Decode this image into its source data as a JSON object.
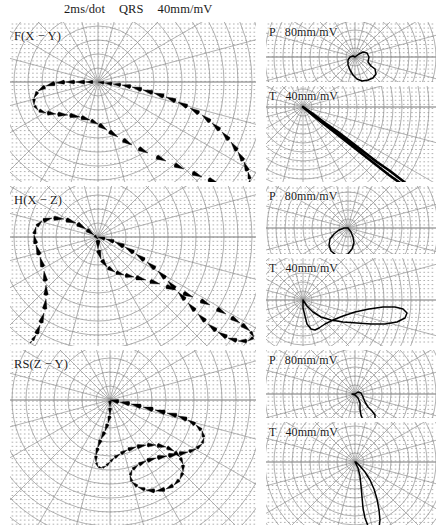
{
  "figure": {
    "type": "vectorcardiogram-polar-loops",
    "header": {
      "speed": "2ms/dot",
      "component": "QRS",
      "gain": "40mm/mV"
    },
    "background_color": "#ffffff",
    "grid_color": "#8c8c8c",
    "dot_color": "#8e8e8e",
    "trace_color": "#000000"
  },
  "panels": {
    "left": [
      {
        "id": "frontal",
        "label": "F(X − Y)",
        "component": "QRS",
        "gain": "40mm/mV"
      },
      {
        "id": "horizontal",
        "label": "H(X − Z)",
        "component": "QRS",
        "gain": "40mm/mV"
      },
      {
        "id": "rightsag",
        "label": "RS(Z − Y)",
        "component": "QRS",
        "gain": "40mm/mV"
      }
    ],
    "right": [
      {
        "id": "frontal-p",
        "label": "P",
        "gain": "80mm/mV"
      },
      {
        "id": "frontal-t",
        "label": "T",
        "gain": "40mm/mV"
      },
      {
        "id": "horizontal-p",
        "label": "P",
        "gain": "80mm/mV"
      },
      {
        "id": "horizontal-t",
        "label": "T",
        "gain": "40mm/mV"
      },
      {
        "id": "rightsag-p",
        "label": "P",
        "gain": "80mm/mV"
      },
      {
        "id": "rightsag-t",
        "label": "T",
        "gain": "40mm/mV"
      }
    ]
  },
  "chart_data": {
    "type": "scatter",
    "title": "",
    "xlabel": "",
    "ylabel": "",
    "grid": true,
    "legend_position": "none",
    "plots": [
      {
        "name": "F(X − Y) QRS",
        "origin": [
          98,
          82
        ],
        "rmax": 170,
        "style": "comet-dash",
        "points": [
          [
            0,
            0
          ],
          [
            7,
            1
          ],
          [
            15,
            2
          ],
          [
            24,
            3
          ],
          [
            34,
            5
          ],
          [
            45,
            8
          ],
          [
            56,
            11
          ],
          [
            68,
            15
          ],
          [
            80,
            20
          ],
          [
            92,
            26
          ],
          [
            104,
            33
          ],
          [
            114,
            41
          ],
          [
            124,
            50
          ],
          [
            133,
            60
          ],
          [
            140,
            70
          ],
          [
            146,
            80
          ],
          [
            150,
            90
          ],
          [
            152,
            98
          ],
          [
            150,
            104
          ],
          [
            144,
            106
          ],
          [
            134,
            105
          ],
          [
            120,
            101
          ],
          [
            104,
            95
          ],
          [
            86,
            87
          ],
          [
            68,
            79
          ],
          [
            50,
            71
          ],
          [
            34,
            63
          ],
          [
            20,
            55
          ],
          [
            9,
            48
          ],
          [
            0,
            42
          ],
          [
            -8,
            38
          ],
          [
            -18,
            35
          ],
          [
            -30,
            33
          ],
          [
            -42,
            32
          ],
          [
            -52,
            31
          ],
          [
            -60,
            28
          ],
          [
            -64,
            23
          ],
          [
            -64,
            16
          ],
          [
            -60,
            9
          ],
          [
            -52,
            4
          ],
          [
            -42,
            1
          ],
          [
            -32,
            0
          ],
          [
            -22,
            0
          ],
          [
            -12,
            0
          ],
          [
            -4,
            0
          ]
        ]
      },
      {
        "name": "F(X − Y) P",
        "origin": [
          355,
          57
        ],
        "rmax": 46,
        "style": "solid",
        "points": [
          [
            0,
            0
          ],
          [
            4,
            -3
          ],
          [
            8,
            -5
          ],
          [
            12,
            -4
          ],
          [
            14,
            0
          ],
          [
            13,
            5
          ],
          [
            16,
            9
          ],
          [
            20,
            12
          ],
          [
            21,
            17
          ],
          [
            18,
            21
          ],
          [
            13,
            23
          ],
          [
            7,
            24
          ],
          [
            2,
            22
          ],
          [
            -2,
            18
          ],
          [
            -5,
            13
          ],
          [
            -7,
            8
          ],
          [
            -7,
            3
          ],
          [
            -5,
            0
          ],
          [
            -2,
            -1
          ],
          [
            0,
            0
          ]
        ]
      },
      {
        "name": "F(X − Y) T",
        "origin": [
          303,
          107
        ],
        "rmax": 120,
        "style": "solid-narrow",
        "points": [
          [
            0,
            0
          ],
          [
            10,
            7
          ],
          [
            22,
            16
          ],
          [
            35,
            25
          ],
          [
            48,
            35
          ],
          [
            61,
            45
          ],
          [
            74,
            55
          ],
          [
            87,
            64
          ],
          [
            100,
            74
          ],
          [
            110,
            82
          ],
          [
            116,
            88
          ],
          [
            112,
            86
          ],
          [
            100,
            78
          ],
          [
            86,
            68
          ],
          [
            72,
            57
          ],
          [
            58,
            46
          ],
          [
            44,
            35
          ],
          [
            30,
            24
          ],
          [
            17,
            14
          ],
          [
            6,
            5
          ],
          [
            0,
            0
          ]
        ]
      },
      {
        "name": "H(X − Z) QRS",
        "origin": [
          98,
          237
        ],
        "rmax": 170,
        "style": "comet-dash",
        "points": [
          [
            0,
            0
          ],
          [
            8,
            2
          ],
          [
            17,
            5
          ],
          [
            27,
            10
          ],
          [
            38,
            17
          ],
          [
            49,
            25
          ],
          [
            60,
            34
          ],
          [
            70,
            44
          ],
          [
            80,
            55
          ],
          [
            90,
            66
          ],
          [
            100,
            77
          ],
          [
            110,
            87
          ],
          [
            120,
            95
          ],
          [
            130,
            101
          ],
          [
            140,
            104
          ],
          [
            150,
            104
          ],
          [
            156,
            100
          ],
          [
            152,
            94
          ],
          [
            142,
            86
          ],
          [
            128,
            77
          ],
          [
            112,
            68
          ],
          [
            95,
            60
          ],
          [
            78,
            53
          ],
          [
            62,
            47
          ],
          [
            48,
            43
          ],
          [
            36,
            40
          ],
          [
            26,
            38
          ],
          [
            17,
            35
          ],
          [
            9,
            30
          ],
          [
            3,
            22
          ],
          [
            0,
            12
          ],
          [
            0,
            2
          ],
          [
            -4,
            -2
          ],
          [
            -12,
            -8
          ],
          [
            -22,
            -14
          ],
          [
            -34,
            -18
          ],
          [
            -46,
            -19
          ],
          [
            -56,
            -16
          ],
          [
            -62,
            -10
          ],
          [
            -64,
            -2
          ],
          [
            -62,
            8
          ],
          [
            -58,
            20
          ],
          [
            -54,
            34
          ],
          [
            -52,
            48
          ],
          [
            -52,
            62
          ],
          [
            -54,
            76
          ],
          [
            -58,
            88
          ],
          [
            -62,
            98
          ],
          [
            -66,
            104
          ],
          [
            -68,
            106
          ]
        ]
      },
      {
        "name": "H(X − Z) P",
        "origin": [
          348,
          228
        ],
        "rmax": 46,
        "style": "solid",
        "points": [
          [
            0,
            0
          ],
          [
            3,
            4
          ],
          [
            5,
            9
          ],
          [
            6,
            15
          ],
          [
            4,
            21
          ],
          [
            0,
            26
          ],
          [
            -6,
            28
          ],
          [
            -12,
            27
          ],
          [
            -17,
            23
          ],
          [
            -19,
            17
          ],
          [
            -18,
            11
          ],
          [
            -14,
            6
          ],
          [
            -9,
            2
          ],
          [
            -4,
            0
          ],
          [
            0,
            0
          ]
        ]
      },
      {
        "name": "H(X − Z) T",
        "origin": [
          303,
          300
        ],
        "rmax": 120,
        "style": "solid",
        "points": [
          [
            0,
            0
          ],
          [
            4,
            6
          ],
          [
            10,
            12
          ],
          [
            18,
            17
          ],
          [
            28,
            20
          ],
          [
            40,
            22
          ],
          [
            54,
            23
          ],
          [
            68,
            24
          ],
          [
            82,
            24
          ],
          [
            94,
            22
          ],
          [
            102,
            18
          ],
          [
            104,
            13
          ],
          [
            100,
            9
          ],
          [
            92,
            7
          ],
          [
            80,
            7
          ],
          [
            66,
            9
          ],
          [
            52,
            12
          ],
          [
            40,
            16
          ],
          [
            30,
            20
          ],
          [
            22,
            24
          ],
          [
            16,
            28
          ],
          [
            12,
            30
          ],
          [
            8,
            29
          ],
          [
            4,
            24
          ],
          [
            2,
            16
          ],
          [
            0,
            8
          ],
          [
            0,
            0
          ]
        ]
      },
      {
        "name": "RS(Z − Y) QRS",
        "origin": [
          110,
          400
        ],
        "rmax": 160,
        "style": "comet-dash",
        "points": [
          [
            0,
            0
          ],
          [
            10,
            2
          ],
          [
            21,
            4
          ],
          [
            33,
            7
          ],
          [
            45,
            10
          ],
          [
            57,
            13
          ],
          [
            68,
            16
          ],
          [
            78,
            20
          ],
          [
            86,
            25
          ],
          [
            92,
            31
          ],
          [
            94,
            38
          ],
          [
            92,
            44
          ],
          [
            86,
            49
          ],
          [
            78,
            52
          ],
          [
            68,
            54
          ],
          [
            57,
            56
          ],
          [
            46,
            58
          ],
          [
            36,
            61
          ],
          [
            28,
            65
          ],
          [
            22,
            70
          ],
          [
            20,
            76
          ],
          [
            22,
            82
          ],
          [
            28,
            87
          ],
          [
            36,
            90
          ],
          [
            46,
            91
          ],
          [
            56,
            89
          ],
          [
            64,
            85
          ],
          [
            70,
            79
          ],
          [
            73,
            72
          ],
          [
            73,
            64
          ],
          [
            70,
            57
          ],
          [
            64,
            51
          ],
          [
            56,
            47
          ],
          [
            46,
            45
          ],
          [
            36,
            45
          ],
          [
            26,
            47
          ],
          [
            17,
            50
          ],
          [
            10,
            54
          ],
          [
            4,
            58
          ],
          [
            0,
            62
          ],
          [
            -4,
            66
          ],
          [
            -8,
            68
          ],
          [
            -12,
            67
          ],
          [
            -14,
            62
          ],
          [
            -14,
            55
          ],
          [
            -12,
            47
          ],
          [
            -9,
            39
          ],
          [
            -5,
            31
          ],
          [
            -2,
            23
          ],
          [
            0,
            15
          ],
          [
            0,
            7
          ],
          [
            0,
            0
          ]
        ]
      },
      {
        "name": "RS(Z − Y) P",
        "origin": [
          355,
          394
        ],
        "rmax": 46,
        "style": "solid",
        "points": [
          [
            0,
            0
          ],
          [
            3,
            -2
          ],
          [
            6,
            -1
          ],
          [
            8,
            3
          ],
          [
            10,
            8
          ],
          [
            13,
            13
          ],
          [
            17,
            17
          ],
          [
            20,
            21
          ],
          [
            20,
            26
          ],
          [
            17,
            29
          ],
          [
            12,
            29
          ],
          [
            8,
            26
          ],
          [
            6,
            21
          ],
          [
            5,
            15
          ],
          [
            5,
            9
          ],
          [
            3,
            4
          ],
          [
            0,
            1
          ],
          [
            -3,
            0
          ],
          [
            0,
            0
          ]
        ]
      },
      {
        "name": "RS(Z − Y) T",
        "origin": [
          355,
          462
        ],
        "rmax": 120,
        "style": "solid",
        "points": [
          [
            0,
            0
          ],
          [
            3,
            6
          ],
          [
            5,
            14
          ],
          [
            6,
            24
          ],
          [
            7,
            35
          ],
          [
            8,
            46
          ],
          [
            10,
            56
          ],
          [
            13,
            64
          ],
          [
            17,
            69
          ],
          [
            21,
            70
          ],
          [
            24,
            66
          ],
          [
            25,
            58
          ],
          [
            24,
            48
          ],
          [
            22,
            37
          ],
          [
            19,
            27
          ],
          [
            15,
            18
          ],
          [
            10,
            10
          ],
          [
            5,
            4
          ],
          [
            1,
            0
          ],
          [
            0,
            0
          ]
        ]
      }
    ]
  }
}
